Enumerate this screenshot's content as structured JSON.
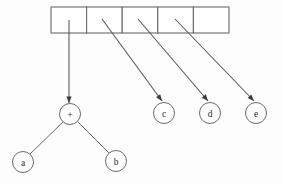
{
  "diagram": {
    "type": "array-of-expression-trees",
    "background_color": "#fdfdfd",
    "line_color": "#6b6b6b",
    "arrow_color": "#3a3a3a",
    "array": {
      "name": "pointer-array",
      "x": 51,
      "y": 7,
      "cell_width": 35.6,
      "cell_height": 26,
      "count": 5,
      "cells": [
        {
          "index": 0,
          "label": "",
          "has_pointer": true,
          "target": "plus-node"
        },
        {
          "index": 1,
          "label": "",
          "has_pointer": true,
          "target": "node-c"
        },
        {
          "index": 2,
          "label": "",
          "has_pointer": true,
          "target": "node-d"
        },
        {
          "index": 3,
          "label": "",
          "has_pointer": true,
          "target": "node-e"
        },
        {
          "index": 4,
          "label": "",
          "has_pointer": false,
          "target": ""
        }
      ]
    },
    "nodes": [
      {
        "id": "plus-node",
        "label": "+",
        "cx": 70,
        "cy": 114,
        "r": 10.5
      },
      {
        "id": "node-a",
        "label": "a",
        "cx": 23,
        "cy": 162,
        "r": 10.5
      },
      {
        "id": "node-b",
        "label": "b",
        "cx": 116,
        "cy": 161,
        "r": 10.5
      },
      {
        "id": "node-c",
        "label": "c",
        "cx": 164,
        "cy": 113,
        "r": 10.5
      },
      {
        "id": "node-d",
        "label": "d",
        "cx": 210,
        "cy": 113,
        "r": 10.5
      },
      {
        "id": "node-e",
        "label": "e",
        "cx": 256,
        "cy": 113,
        "r": 10.5
      }
    ],
    "pointers": [
      {
        "id": "pointer-0",
        "from_cell": 0,
        "to_node": "plus-node",
        "x1": 69,
        "y1": 20,
        "x2": 69,
        "y2": 103
      },
      {
        "id": "pointer-1",
        "from_cell": 1,
        "to_node": "node-c",
        "x1": 102,
        "y1": 19,
        "x2": 162,
        "y2": 101
      },
      {
        "id": "pointer-2",
        "from_cell": 2,
        "to_node": "node-d",
        "x1": 138,
        "y1": 19,
        "x2": 208,
        "y2": 101
      },
      {
        "id": "pointer-3",
        "from_cell": 3,
        "to_node": "node-e",
        "x1": 175,
        "y1": 19,
        "x2": 254,
        "y2": 101
      }
    ],
    "tree_edges": [
      {
        "id": "edge-plus-a",
        "from": "plus-node",
        "to": "node-a",
        "x1": 63,
        "y1": 122,
        "x2": 30,
        "y2": 154
      },
      {
        "id": "edge-plus-b",
        "from": "plus-node",
        "to": "node-b",
        "x1": 77,
        "y1": 121,
        "x2": 109,
        "y2": 153
      }
    ]
  }
}
